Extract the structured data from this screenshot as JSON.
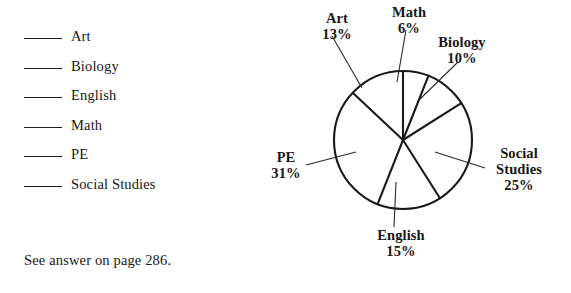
{
  "legend": {
    "items": [
      {
        "label": "Art"
      },
      {
        "label": "Biology"
      },
      {
        "label": "English"
      },
      {
        "label": "Math"
      },
      {
        "label": "PE"
      },
      {
        "label": "Social Studies"
      }
    ]
  },
  "footer": {
    "note": "See answer on page 286."
  },
  "chart_data": {
    "type": "pie",
    "title": "",
    "subtitle": "",
    "xlabel": "",
    "ylabel": "",
    "legend_position": "callout-labels",
    "grid": false,
    "units": "percent",
    "start_angle_deg": 0,
    "direction": "clockwise",
    "categories": [
      "Math",
      "Biology",
      "Social Studies",
      "English",
      "PE",
      "Art"
    ],
    "values": [
      6,
      10,
      25,
      15,
      31,
      13
    ],
    "slices": [
      {
        "name": "Math",
        "value": 6,
        "value_label": "6%",
        "start_deg": 0,
        "end_deg": 21.6
      },
      {
        "name": "Biology",
        "value": 10,
        "value_label": "10%",
        "start_deg": 21.6,
        "end_deg": 57.6
      },
      {
        "name": "Social Studies",
        "value": 25,
        "value_label": "25%",
        "start_deg": 57.6,
        "end_deg": 147.6
      },
      {
        "name": "English",
        "value": 15,
        "value_label": "15%",
        "start_deg": 147.6,
        "end_deg": 201.6
      },
      {
        "name": "PE",
        "value": 31,
        "value_label": "31%",
        "start_deg": 201.6,
        "end_deg": 313.2
      },
      {
        "name": "Art",
        "value": 13,
        "value_label": "13%",
        "start_deg": 313.2,
        "end_deg": 360
      }
    ],
    "labels": {
      "art": {
        "name": "Art",
        "pct": "13%"
      },
      "math": {
        "name": "Math",
        "pct": "6%"
      },
      "biology": {
        "name": "Biology",
        "pct": "10%"
      },
      "social": {
        "name": "Social Studies",
        "name_line1": "Social",
        "name_line2": "Studies",
        "pct": "25%"
      },
      "pe": {
        "name": "PE",
        "pct": "31%"
      },
      "english": {
        "name": "English",
        "pct": "15%"
      }
    },
    "colors": {
      "slice_fill": "#ffffff",
      "outline": "#1a1a1d",
      "leader": "#2a2a2e",
      "text": "#17171a",
      "background": "#ffffff"
    }
  }
}
